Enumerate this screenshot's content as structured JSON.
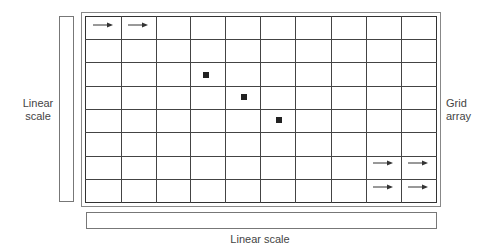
{
  "diagram": {
    "left_axis_label": "Linear scale",
    "bottom_axis_label": "Linear scale",
    "grid_label": "Grid array",
    "grid": {
      "columns": 10,
      "rows": 8
    },
    "column_lines_x": [
      121,
      156,
      190,
      225,
      260,
      295,
      331,
      366,
      401
    ],
    "row_lines_y": [
      39,
      62,
      86,
      109,
      132,
      156,
      179
    ],
    "markers": [
      {
        "type": "square",
        "x": 203,
        "y": 72
      },
      {
        "type": "square",
        "x": 241,
        "y": 94
      },
      {
        "type": "square",
        "x": 276,
        "y": 117
      }
    ],
    "arrows": [
      {
        "direction": "right",
        "x": 93,
        "y": 25
      },
      {
        "direction": "right",
        "x": 128,
        "y": 25
      },
      {
        "direction": "right",
        "x": 373,
        "y": 163
      },
      {
        "direction": "right",
        "x": 408,
        "y": 163
      },
      {
        "direction": "right",
        "x": 373,
        "y": 187
      },
      {
        "direction": "right",
        "x": 408,
        "y": 187
      }
    ],
    "colors": {
      "line": "#444444",
      "marker": "#222222",
      "label": "#444444"
    }
  }
}
